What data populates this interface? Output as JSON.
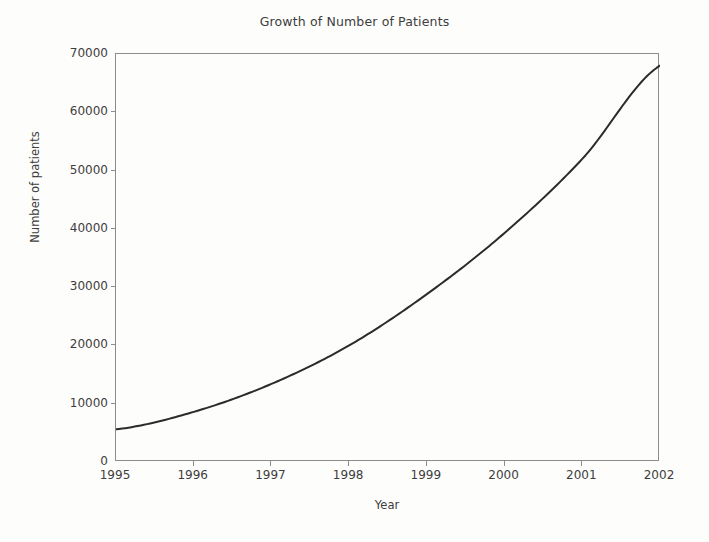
{
  "chart_data": {
    "type": "line",
    "title": "Growth of Number of Patients",
    "xlabel": "Year",
    "ylabel": "Number of patients",
    "x": [
      1995,
      1996,
      1997,
      1998,
      1999,
      2000,
      2001,
      2002
    ],
    "categories": [
      "1995",
      "1996",
      "1997",
      "1998",
      "1999",
      "2000",
      "2001",
      "2002"
    ],
    "values": [
      5600,
      8600,
      13400,
      20000,
      28800,
      39300,
      52000,
      68000
    ],
    "series": [
      {
        "name": "Number of patients",
        "values": [
          5600,
          8600,
          13400,
          20000,
          28800,
          39300,
          52000,
          68000
        ]
      }
    ],
    "xlim": [
      1995,
      2002
    ],
    "ylim": [
      0,
      70000
    ],
    "ytick_labels": [
      "0",
      "10000",
      "20000",
      "30000",
      "40000",
      "50000",
      "60000",
      "70000"
    ],
    "ytick_values": [
      0,
      10000,
      20000,
      30000,
      40000,
      50000,
      60000,
      70000
    ],
    "xtick_labels": [
      "1995",
      "1996",
      "1997",
      "1998",
      "1999",
      "2000",
      "2001",
      "2002"
    ],
    "xtick_values": [
      1995,
      1996,
      1997,
      1998,
      1999,
      2000,
      2001,
      2002
    ],
    "grid": false,
    "legend": false,
    "legend_position": "none",
    "line_color": "#2b2b2b",
    "line_width": 2,
    "axis_color": "#8c8c8c",
    "background_color": "#fdfdfc",
    "text_color": "#3d3d3d"
  }
}
